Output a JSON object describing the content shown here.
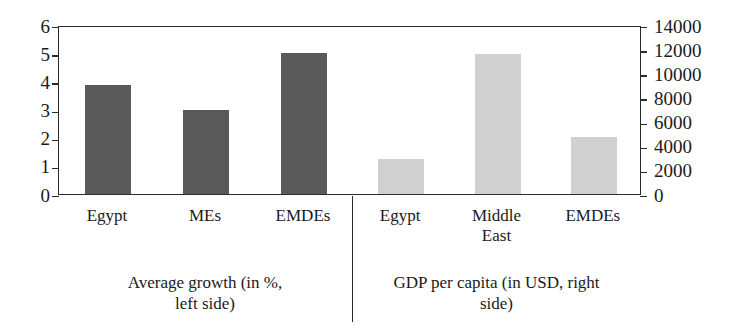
{
  "chart_data": {
    "type": "bar",
    "title": "",
    "subtitle": "",
    "grid": false,
    "legend_position": "none",
    "panels": [
      {
        "id": "average-growth",
        "caption": "Average growth (in %,\nleft side)",
        "axis_side": "left",
        "axis_label": "",
        "ylim": [
          0,
          6
        ],
        "ytick_step": 1,
        "yticks": [
          "6",
          "5",
          "4",
          "3",
          "2",
          "1",
          "0"
        ],
        "series_color": "#595959",
        "categories": [
          "Egypt",
          "MEs",
          "EMDEs"
        ],
        "values": [
          3.88,
          3.0,
          5.0
        ]
      },
      {
        "id": "gdp-per-capita",
        "caption": "GDP per capita (in USD, right\nside)",
        "axis_side": "right",
        "axis_label": "",
        "ylim": [
          0,
          14000
        ],
        "ytick_step": 2000,
        "yticks": [
          "14000",
          "12000",
          "10000",
          "8000",
          "6000",
          "4000",
          "2000",
          "0"
        ],
        "series_color": "#d0d0d0",
        "categories": [
          "Egypt",
          "Middle\nEast",
          "EMDEs"
        ],
        "values": [
          2900,
          11600,
          4700
        ]
      }
    ]
  },
  "axes": {
    "left": {
      "labels": [
        "6",
        "5",
        "4",
        "3",
        "2",
        "1",
        "0"
      ],
      "min": 0,
      "max": 6
    },
    "right": {
      "labels": [
        "14000",
        "12000",
        "10000",
        "8000",
        "6000",
        "4000",
        "2000",
        "0"
      ],
      "min": 0,
      "max": 14000
    }
  },
  "categories": {
    "left": [
      "Egypt",
      "MEs",
      "EMDEs"
    ],
    "right": [
      "Egypt",
      "Middle\nEast",
      "EMDEs"
    ]
  },
  "captions": {
    "left": "Average growth (in %,\nleft side)",
    "right": "GDP per capita (in USD, right\nside)"
  },
  "colors": {
    "bar_dark": "#595959",
    "bar_light": "#d0d0d0",
    "axis": "#2b2b2b",
    "background": "#ffffff",
    "text": "#1a1a1a"
  }
}
